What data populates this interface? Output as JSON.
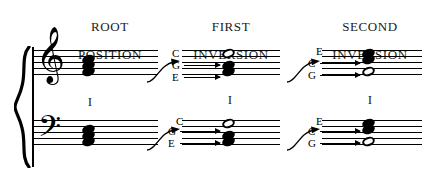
{
  "figure": {
    "columns": [
      {
        "id": "root",
        "heading_line1": "ROOT",
        "heading_line2": "POSITION",
        "roman_numeral": "I",
        "treble": {
          "notes": [
            "E",
            "G",
            "C"
          ],
          "noteheads": [
            "filled",
            "filled",
            "filled"
          ],
          "labels": []
        },
        "bass": {
          "notes": [
            "E",
            "G",
            "C"
          ],
          "noteheads": [
            "filled",
            "filled",
            "filled"
          ],
          "labels": []
        }
      },
      {
        "id": "first",
        "heading_line1": "FIRST",
        "heading_line2": "INVERSION",
        "roman_numeral": "I",
        "treble": {
          "notes": [
            "E",
            "G",
            "C"
          ],
          "noteheads": [
            "filled",
            "filled",
            "open"
          ],
          "labels": [
            "C",
            "G",
            "E"
          ]
        },
        "bass": {
          "notes": [
            "E",
            "G",
            "C"
          ],
          "noteheads": [
            "filled",
            "filled",
            "open"
          ],
          "labels": [
            "C",
            "G",
            "E"
          ]
        }
      },
      {
        "id": "second",
        "heading_line1": "SECOND",
        "heading_line2": "INVERSION",
        "roman_numeral": "I",
        "treble": {
          "notes": [
            "G",
            "C",
            "E"
          ],
          "noteheads": [
            "open",
            "filled",
            "filled"
          ],
          "labels": [
            "E",
            "C",
            "G"
          ]
        },
        "bass": {
          "notes": [
            "G",
            "C",
            "E"
          ],
          "noteheads": [
            "open",
            "filled",
            "filled"
          ],
          "labels": [
            "E",
            "C",
            "G"
          ]
        }
      }
    ],
    "clefs": {
      "treble_glyph": "𝄞",
      "bass_glyph": "𝄢"
    },
    "colors": {
      "ink": "#000000",
      "paper": "#ffffff"
    }
  }
}
